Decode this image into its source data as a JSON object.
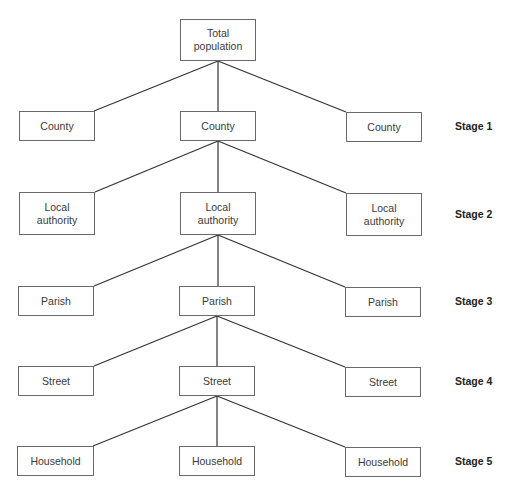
{
  "diagram": {
    "type": "tree",
    "root": {
      "label": "Total\npopulation"
    },
    "levels": [
      {
        "stage": "Stage 1",
        "nodes": [
          "County",
          "County",
          "County"
        ]
      },
      {
        "stage": "Stage 2",
        "nodes": [
          "Local\nauthority",
          "Local\nauthority",
          "Local\nauthority"
        ]
      },
      {
        "stage": "Stage 3",
        "nodes": [
          "Parish",
          "Parish",
          "Parish"
        ]
      },
      {
        "stage": "Stage 4",
        "nodes": [
          "Street",
          "Street",
          "Street"
        ]
      },
      {
        "stage": "Stage 5",
        "nodes": [
          "Household",
          "Household",
          "Household"
        ]
      }
    ],
    "expanded_child": "center",
    "colors": {
      "line": "#333333",
      "border": "#6a6a6a",
      "text": "#3a3a3a"
    }
  }
}
